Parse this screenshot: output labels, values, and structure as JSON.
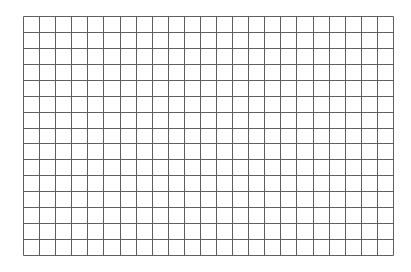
{
  "grid": {
    "columns": 23,
    "rows": 15,
    "left": 23,
    "top": 16,
    "width": 370,
    "height": 239,
    "line_color": "#5f5f5f",
    "background_color": "#ffffff"
  }
}
